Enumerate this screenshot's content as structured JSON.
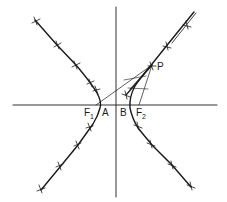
{
  "diagram": {
    "type": "hyperbola-construction",
    "labels": {
      "F1": {
        "main": "F",
        "sub": "1"
      },
      "F2": {
        "main": "F",
        "sub": "2"
      },
      "A": "A",
      "B": "B",
      "P": "P"
    },
    "colors": {
      "stroke": "#1a1a1a",
      "background": "#ffffff"
    }
  }
}
